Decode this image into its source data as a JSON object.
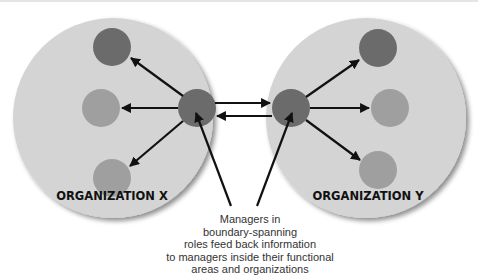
{
  "diagram": {
    "organizations": [
      {
        "label": "ORGANIZATION X"
      },
      {
        "label": "ORGANIZATION Y"
      }
    ],
    "caption_lines": [
      "Managers in",
      "boundary-spanning",
      "roles feed back information",
      "to managers inside their functional",
      "areas and organizations"
    ],
    "colors": {
      "organization_fill": "#d4d4d4",
      "dark_node": "#6b6b6b",
      "light_node": "#9f9f9f",
      "arrow": "#111111"
    }
  }
}
